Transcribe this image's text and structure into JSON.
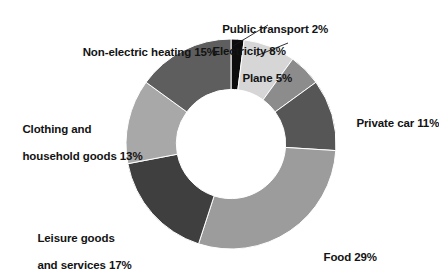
{
  "chart_data": {
    "type": "pie",
    "variant": "donut",
    "title": "",
    "subtitle": "",
    "xlabel": "",
    "ylabel": "",
    "legend_position": "none",
    "grid": false,
    "units": "percent",
    "total": 100,
    "start_angle_deg": 0,
    "direction": "clockwise",
    "inner_radius_ratio": 0.52,
    "categories": [
      "Public transport",
      "Electricity",
      "Plane",
      "Private car",
      "Food",
      "Leisure goods and services",
      "Clothing and household goods",
      "Non-electric heating"
    ],
    "values": [
      2,
      8,
      5,
      11,
      29,
      17,
      13,
      15
    ],
    "colors": [
      "#0d0d0d",
      "#d6d6d6",
      "#8c8c8c",
      "#565656",
      "#9c9c9c",
      "#3f3f3f",
      "#a8a8a8",
      "#5e5e5e"
    ],
    "slices": [
      {
        "name": "Public transport",
        "value": 2,
        "color": "#0d0d0d",
        "label": "Public transport 2%",
        "label_lines": [
          "Public transport 2%"
        ],
        "has_leader_line": true
      },
      {
        "name": "Electricity",
        "value": 8,
        "color": "#d6d6d6",
        "label": "Electricity 8%",
        "label_lines": [
          "Electricity 8%"
        ],
        "has_leader_line": true
      },
      {
        "name": "Plane",
        "value": 5,
        "color": "#8c8c8c",
        "label": "Plane 5%",
        "label_lines": [
          "Plane 5%"
        ],
        "has_leader_line": false
      },
      {
        "name": "Private car",
        "value": 11,
        "color": "#565656",
        "label": "Private car 11%",
        "label_lines": [
          "Private car 11%"
        ],
        "has_leader_line": false
      },
      {
        "name": "Food",
        "value": 29,
        "color": "#9c9c9c",
        "label": "Food 29%",
        "label_lines": [
          "Food 29%"
        ],
        "has_leader_line": false
      },
      {
        "name": "Leisure goods and services",
        "value": 17,
        "color": "#3f3f3f",
        "label": "Leisure goods and services 17%",
        "label_lines": [
          "Leisure goods",
          "and services 17%"
        ],
        "has_leader_line": false
      },
      {
        "name": "Clothing and household goods",
        "value": 13,
        "color": "#a8a8a8",
        "label": "Clothing and household goods 13%",
        "label_lines": [
          "Clothing and",
          "household goods 13%"
        ],
        "has_leader_line": false
      },
      {
        "name": "Non-electric heating",
        "value": 15,
        "color": "#5e5e5e",
        "label": "Non-electric heating 15%",
        "label_lines": [
          "Non-electric heating 15%"
        ],
        "has_leader_line": false
      }
    ]
  },
  "labels": {
    "public_transport_l1": "Public transport 2%",
    "electricity_l1": "Electricity 8%",
    "plane_l1": "Plane 5%",
    "private_car_l1": "Private car 11%",
    "food_l1": "Food 29%",
    "leisure_l1": "Leisure goods",
    "leisure_l2": "and services 17%",
    "clothing_l1": "Clothing and",
    "clothing_l2": "household goods 13%",
    "heating_l1": "Non-electric heating 15%"
  }
}
